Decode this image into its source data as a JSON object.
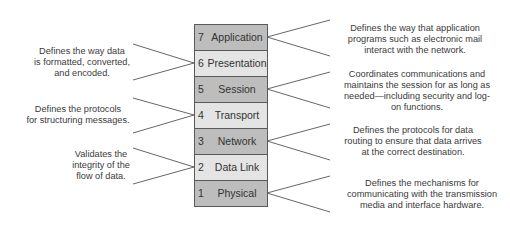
{
  "diagram": {
    "colors": {
      "layer_dark": "#bdbdbd",
      "layer_light": "#e4e4e4",
      "border": "#5a5a5a",
      "line": "#555555",
      "text": "#3a3a3a"
    },
    "layers": [
      {
        "number": "7",
        "name": "Application",
        "shade": "dark"
      },
      {
        "number": "6",
        "name": "Presentation",
        "shade": "light"
      },
      {
        "number": "5",
        "name": "Session",
        "shade": "dark"
      },
      {
        "number": "4",
        "name": "Transport",
        "shade": "light"
      },
      {
        "number": "3",
        "name": "Network",
        "shade": "dark"
      },
      {
        "number": "2",
        "name": "Data Link",
        "shade": "light"
      },
      {
        "number": "1",
        "name": "Physical",
        "shade": "dark"
      }
    ],
    "left_descriptions": [
      {
        "layer": "6",
        "lines": [
          "Defines the way data",
          "is formatted, converted,",
          "and encoded."
        ]
      },
      {
        "layer": "4",
        "lines": [
          "Defines the protocols",
          "for structuring messages."
        ]
      },
      {
        "layer": "2",
        "lines": [
          "Validates the",
          "integrity of the",
          "flow of data."
        ]
      }
    ],
    "right_descriptions": [
      {
        "layer": "7",
        "lines": [
          "Defines the way that application",
          "programs such as electronic mail",
          "interact with the network."
        ]
      },
      {
        "layer": "5",
        "lines": [
          "Coordinates communications and",
          "maintains the session for as long as",
          "needed—including security and log-",
          "on functions."
        ]
      },
      {
        "layer": "3",
        "lines": [
          "Defines the protocols for data",
          "routing to ensure that data arrives",
          "at the correct destination."
        ]
      },
      {
        "layer": "1",
        "lines": [
          "Defines the mechanisms for",
          "communicating with the transmission",
          "media and interface hardware."
        ]
      }
    ]
  }
}
